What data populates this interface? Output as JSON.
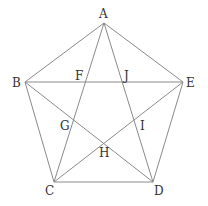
{
  "diagram": {
    "type": "regular pentagon with diagonals (pentagram)",
    "points": {
      "A": {
        "label": "A",
        "x": 104,
        "y": 23
      },
      "B": {
        "label": "B",
        "x": 25,
        "y": 82
      },
      "C": {
        "label": "C",
        "x": 54,
        "y": 182
      },
      "D": {
        "label": "D",
        "x": 153,
        "y": 182
      },
      "E": {
        "label": "E",
        "x": 183,
        "y": 82
      },
      "F": {
        "label": "F"
      },
      "G": {
        "label": "G"
      },
      "H": {
        "label": "H"
      },
      "I": {
        "label": "I"
      },
      "J": {
        "label": "J"
      }
    },
    "segments": [
      "AB",
      "AE",
      "BC",
      "ED",
      "CD",
      "AC",
      "AD",
      "BD",
      "EC",
      "BE"
    ],
    "line_color": "#8a8a8a",
    "label_color": "#333333"
  }
}
